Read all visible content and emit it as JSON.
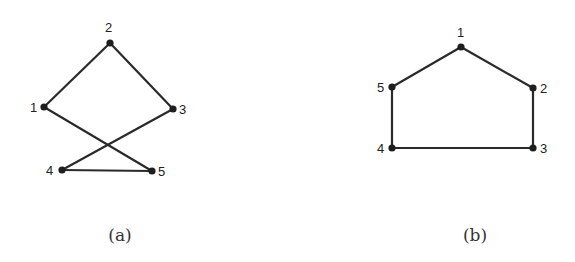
{
  "graphs": [
    {
      "id": "a",
      "caption": "(a)",
      "caption_pos": [
        120,
        241
      ],
      "nodes": [
        {
          "label": "1",
          "x": 44,
          "y": 107,
          "lx": 30,
          "ly": 112
        },
        {
          "label": "2",
          "x": 110,
          "y": 43,
          "lx": 105,
          "ly": 32
        },
        {
          "label": "3",
          "x": 173,
          "y": 109,
          "lx": 179,
          "ly": 114
        },
        {
          "label": "4",
          "x": 62,
          "y": 170,
          "lx": 46,
          "ly": 175
        },
        {
          "label": "5",
          "x": 152,
          "y": 171,
          "lx": 158,
          "ly": 176
        }
      ],
      "edges": [
        [
          "1",
          "2"
        ],
        [
          "2",
          "3"
        ],
        [
          "1",
          "5"
        ],
        [
          "3",
          "4"
        ],
        [
          "4",
          "5"
        ]
      ]
    },
    {
      "id": "b",
      "caption": "(b)",
      "caption_pos": [
        475,
        241
      ],
      "nodes": [
        {
          "label": "1",
          "x": 461,
          "y": 47,
          "lx": 457,
          "ly": 37
        },
        {
          "label": "2",
          "x": 533,
          "y": 88,
          "lx": 540,
          "ly": 93
        },
        {
          "label": "3",
          "x": 533,
          "y": 148,
          "lx": 540,
          "ly": 153
        },
        {
          "label": "4",
          "x": 392,
          "y": 148,
          "lx": 377,
          "ly": 153
        },
        {
          "label": "5",
          "x": 392,
          "y": 87,
          "lx": 377,
          "ly": 92
        }
      ],
      "edges": [
        [
          "1",
          "2"
        ],
        [
          "2",
          "3"
        ],
        [
          "3",
          "4"
        ],
        [
          "4",
          "5"
        ],
        [
          "5",
          "1"
        ]
      ]
    }
  ],
  "colors": {
    "edge": "#2a2a2a",
    "node": "#1e1e1e",
    "label": "#222222",
    "background": "#ffffff"
  }
}
